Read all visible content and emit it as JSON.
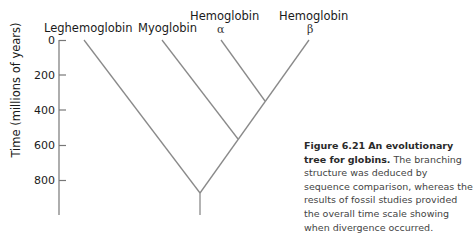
{
  "labels": {
    "leghemoglobin": "Leghemoglobin",
    "myoglobin": "Myoglobin",
    "hemoglobin_alpha": "Hemoglobin",
    "alpha_symbol": "α",
    "hemoglobin_beta": "Hemoglobin",
    "beta_symbol": "β"
  },
  "axis": {
    "title": "Time (millions of years)",
    "ticks": [
      "0",
      "200",
      "400",
      "600",
      "800"
    ]
  },
  "caption": {
    "figure_number": "Figure 6.21",
    "title_part1": "An evolutionary tree for",
    "title_part2": "globins.",
    "body": "The branching structure was deduced by sequence comparison, whereas the results of fossil studies provided the overall time scale showing when divergence occurred."
  },
  "colors": {
    "line": "#8a8a8a",
    "axis": "#777777",
    "text": "#1a1a1a",
    "caption": "#444444"
  }
}
